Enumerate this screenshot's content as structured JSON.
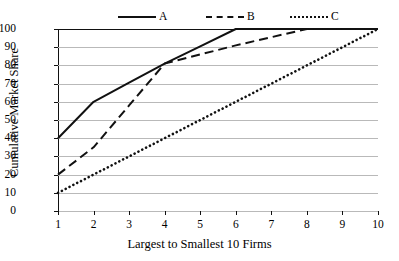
{
  "chart_data": {
    "type": "line",
    "title": "",
    "xlabel": "Largest to Smallest 10 Firms",
    "ylabel": "Cumulative Market Share",
    "x": [
      1,
      2,
      3,
      4,
      5,
      6,
      7,
      8,
      9,
      10
    ],
    "xlim": [
      1,
      10
    ],
    "ylim": [
      0,
      100
    ],
    "xticks": [
      "1",
      "2",
      "3",
      "4",
      "5",
      "6",
      "7",
      "8",
      "9",
      "10"
    ],
    "yticks": [
      "0",
      "10",
      "20",
      "30",
      "40",
      "50",
      "60",
      "70",
      "80",
      "90",
      "100"
    ],
    "grid": "horizontal",
    "legend_position": "top-center",
    "series": [
      {
        "name": "A",
        "style": "solid",
        "color": "#111111",
        "values": [
          40,
          60,
          70.5,
          81,
          90.5,
          100,
          100,
          100,
          100,
          100
        ]
      },
      {
        "name": "B",
        "style": "dashed",
        "color": "#111111",
        "values": [
          20,
          35,
          58,
          81,
          86,
          91,
          95.5,
          100,
          100,
          100
        ]
      },
      {
        "name": "C",
        "style": "dotted",
        "color": "#111111",
        "values": [
          10,
          20,
          30,
          40,
          50,
          60,
          70,
          80,
          90,
          100
        ]
      }
    ]
  },
  "axes": {
    "y_title": "Cumulative Market Share",
    "x_title": "Largest to Smallest 10 Firms"
  },
  "legend": {
    "entries": [
      {
        "label": "A",
        "style": "solid"
      },
      {
        "label": "B",
        "style": "dashed"
      },
      {
        "label": "C",
        "style": "dotted"
      }
    ]
  }
}
